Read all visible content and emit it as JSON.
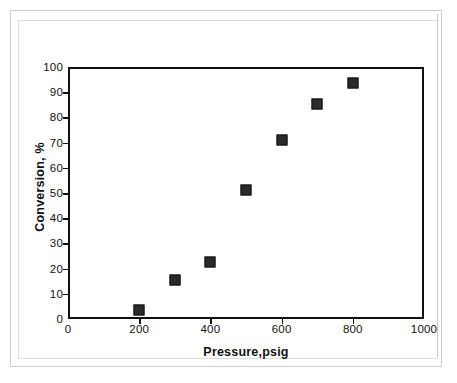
{
  "chart_data": {
    "type": "scatter",
    "title": "",
    "xlabel": "Pressure,psig",
    "ylabel": "Conversion, %",
    "xlim": [
      0,
      1000
    ],
    "ylim": [
      0,
      100
    ],
    "xticks": [
      0,
      200,
      400,
      600,
      800,
      1000
    ],
    "yticks": [
      0,
      10,
      20,
      30,
      40,
      50,
      60,
      70,
      80,
      90,
      100
    ],
    "xtick_labels": [
      "0",
      "200",
      "400",
      "600",
      "800",
      "1000"
    ],
    "ytick_labels": [
      "0",
      "10",
      "20",
      "30",
      "40",
      "50",
      "60",
      "70",
      "80",
      "90",
      "100"
    ],
    "grid": false,
    "legend": false,
    "marker": "square",
    "marker_color": "#2a2a2a",
    "axis_color": "#111111",
    "background": "#ffffff",
    "series": [
      {
        "name": "Conversion vs Pressure",
        "points": [
          {
            "x": 200,
            "y": 3.5
          },
          {
            "x": 300,
            "y": 15.5
          },
          {
            "x": 400,
            "y": 22.5
          },
          {
            "x": 500,
            "y": 51
          },
          {
            "x": 600,
            "y": 71
          },
          {
            "x": 700,
            "y": 85.5
          },
          {
            "x": 800,
            "y": 93.5
          }
        ]
      }
    ]
  }
}
